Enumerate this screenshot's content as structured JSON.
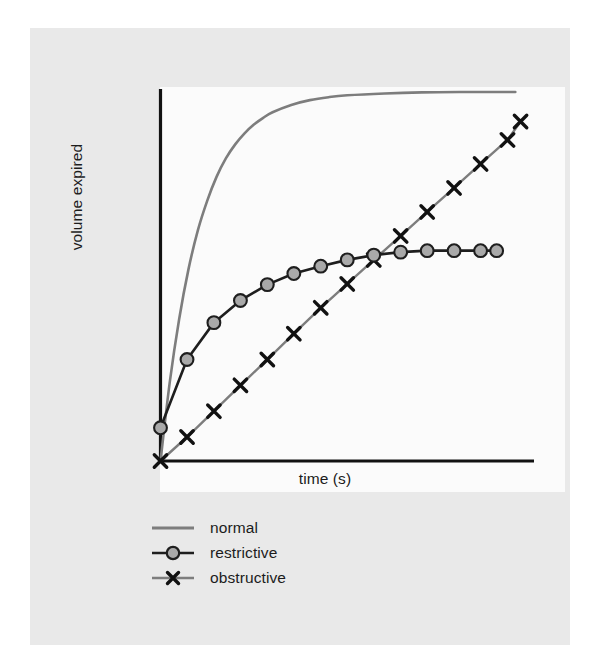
{
  "figure": {
    "background_color": "#e9e9e9",
    "panel_color": "#fbfbfb",
    "axis_color": "#121212"
  },
  "axes": {
    "x_title": "time (s)",
    "y_title": "volume expired"
  },
  "legend": {
    "position": "below-axes-left",
    "items": [
      {
        "label": "normal",
        "marker": "none",
        "color": "#7d7d7d",
        "marker_face": "none"
      },
      {
        "label": "restrictive",
        "marker": "circle",
        "color": "#1e1e1e",
        "marker_face": "#a9a9a9"
      },
      {
        "label": "obstructive",
        "marker": "x",
        "color": "#7d7d7d",
        "marker_face": "#111111"
      }
    ]
  },
  "chart_data": {
    "type": "line",
    "title": "",
    "xlabel": "time (s)",
    "ylabel": "volume expired",
    "xlim": [
      0,
      10
    ],
    "ylim": [
      0,
      1
    ],
    "grid": false,
    "legend_position": "lower left, outside axes",
    "axis_ticks": "none",
    "x": [
      0,
      0.36,
      0.71,
      1.07,
      1.43,
      1.79,
      2.14,
      2.5,
      2.86,
      3.21,
      3.57,
      3.93,
      4.29,
      4.64,
      5.0,
      5.36,
      5.71,
      6.07,
      6.43,
      6.79,
      7.14,
      7.5,
      7.86,
      8.21,
      8.57,
      8.93,
      9.29,
      9.64,
      10.0
    ],
    "series": [
      {
        "name": "normal",
        "marker": "none",
        "color": "#7d7d7d",
        "description": "fast exponential rise to full plateau",
        "x": [
          0,
          0.25,
          0.5,
          0.75,
          1.0,
          1.25,
          1.5,
          1.75,
          2.0,
          2.25,
          2.5,
          2.75,
          3.0,
          3.5,
          4.0,
          4.5,
          5.0,
          6.0,
          7.0,
          8.0,
          9.0,
          9.5
        ],
        "values": [
          0.0,
          0.215,
          0.385,
          0.52,
          0.625,
          0.705,
          0.77,
          0.82,
          0.858,
          0.888,
          0.912,
          0.93,
          0.945,
          0.965,
          0.978,
          0.986,
          0.991,
          0.996,
          0.999,
          1.0,
          1.0,
          1.0
        ]
      },
      {
        "name": "restrictive",
        "marker": "circle",
        "color": "#1e1e1e",
        "marker_face": "#a9a9a9",
        "description": "reduced total volume, plateaus early at about 57% of normal",
        "x": [
          0,
          0.71,
          1.43,
          2.14,
          2.86,
          3.57,
          4.29,
          5.0,
          5.71,
          6.43,
          7.14,
          7.86,
          8.57,
          9.0
        ],
        "values": [
          0.09,
          0.275,
          0.375,
          0.435,
          0.478,
          0.508,
          0.528,
          0.545,
          0.558,
          0.566,
          0.57,
          0.57,
          0.57,
          0.57
        ]
      },
      {
        "name": "obstructive",
        "marker": "x",
        "color": "#7d7d7d",
        "marker_face": "#111111",
        "description": "slow near-linear rise, still climbing at end of test",
        "x": [
          0,
          0.71,
          1.43,
          2.14,
          2.86,
          3.57,
          4.29,
          5.0,
          5.71,
          6.43,
          7.14,
          7.86,
          8.57,
          9.29,
          9.64
        ],
        "values": [
          0.0,
          0.065,
          0.135,
          0.205,
          0.275,
          0.345,
          0.415,
          0.48,
          0.545,
          0.61,
          0.675,
          0.74,
          0.805,
          0.87,
          0.92
        ]
      }
    ]
  }
}
